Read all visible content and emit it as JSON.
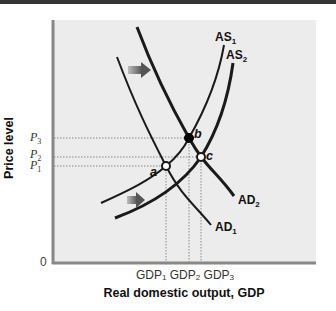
{
  "diagram": {
    "type": "aggregate-demand-aggregate-supply",
    "y_axis": {
      "label": "Price level",
      "origin_label": "0"
    },
    "x_axis": {
      "label": "Real domestic output, GDP"
    },
    "price_levels": [
      {
        "id": "P3",
        "base": "P",
        "sub": "3"
      },
      {
        "id": "P2",
        "base": "P",
        "sub": "2"
      },
      {
        "id": "P1",
        "base": "P",
        "sub": "1"
      }
    ],
    "gdp_levels": [
      {
        "id": "GDP1",
        "base": "GDP",
        "sub": "1"
      },
      {
        "id": "GDP2",
        "base": "GDP",
        "sub": "2"
      },
      {
        "id": "GDP3",
        "base": "GDP",
        "sub": "3"
      }
    ],
    "curves": [
      {
        "id": "AS1",
        "base": "AS",
        "sub": "1",
        "kind": "supply"
      },
      {
        "id": "AS2",
        "base": "AS",
        "sub": "2",
        "kind": "supply"
      },
      {
        "id": "AD1",
        "base": "AD",
        "sub": "1",
        "kind": "demand"
      },
      {
        "id": "AD2",
        "base": "AD",
        "sub": "2",
        "kind": "demand"
      }
    ],
    "points": [
      {
        "id": "a",
        "label": "a",
        "at": "AD1 ∩ AS1",
        "price": "P1",
        "gdp": "GDP1",
        "filled": false
      },
      {
        "id": "b",
        "label": "b",
        "at": "AD2 ∩ AS1",
        "price": "P3",
        "gdp": "GDP2",
        "filled": true
      },
      {
        "id": "c",
        "label": "c",
        "at": "AD2 ∩ AS2",
        "price": "P2",
        "gdp": "GDP3",
        "filled": false
      }
    ],
    "shift_arrows": [
      {
        "id": "ad-shift",
        "description": "AD shifts right (AD1 to AD2)"
      },
      {
        "id": "as-shift",
        "description": "AS shifts right (AS1 to AS2)"
      }
    ],
    "colors": {
      "plot_background": "#ececec",
      "curve": "#1a1a1a",
      "axis": "#888888",
      "guide": "#888888",
      "arrow": "#666666"
    }
  }
}
